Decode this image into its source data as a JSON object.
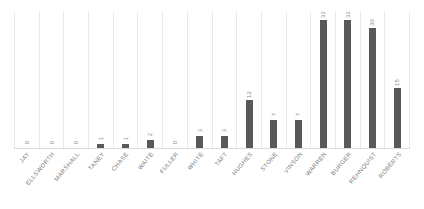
{
  "chart_data": {
    "type": "bar",
    "title": "",
    "subtitle": "",
    "xlabel": "",
    "ylabel": "",
    "ylim": [
      0,
      34
    ],
    "grid": "vertical-category-separators",
    "legend": "none",
    "orientation": "vertical",
    "bar_color": "#595959",
    "value_label_color": "#8c8c8c",
    "category_label_color": "#7a7a7a",
    "gridline_color": "#e8e8e8",
    "axis_color": "#dcdcdc",
    "categories": [
      "JAY",
      "ELLSWORTH",
      "MARSHALL",
      "TANEY",
      "CHASE",
      "WAITE",
      "FULLER",
      "WHITE",
      "TAFT",
      "HUGHES",
      "STONE",
      "VINSON",
      "WARREN",
      "BURGER",
      "REHNQUIST",
      "ROBERTS"
    ],
    "values": [
      0,
      0,
      0,
      1,
      1,
      2,
      0,
      3,
      3,
      12,
      7,
      7,
      32,
      32,
      30,
      15
    ],
    "value_labels": [
      "0",
      "0",
      "0",
      "1",
      "1",
      "2",
      "0",
      "3",
      "3",
      "12",
      "7",
      "7",
      "32",
      "32",
      "30",
      "15"
    ]
  }
}
